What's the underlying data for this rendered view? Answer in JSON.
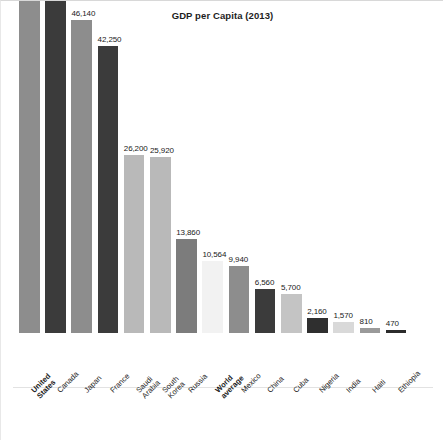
{
  "chart_data": {
    "type": "bar",
    "title": "GDP per Capita (2013)",
    "xlabel": "",
    "ylabel": "",
    "ylim": [
      0,
      53670
    ],
    "grid": false,
    "legend": null,
    "value_labels_shown": true,
    "categories": [
      "United\nStates",
      "Canada",
      "Japan",
      "France",
      "Saudi\nArabia",
      "South\nKorea",
      "Russia",
      "World\naverage",
      "Mexico",
      "China",
      "Cuba",
      "Nigeria",
      "India",
      "Haiti",
      "Ethiopia"
    ],
    "values": [
      53670,
      52200,
      46140,
      42250,
      26200,
      25920,
      13860,
      10564,
      9940,
      6560,
      5700,
      2160,
      1570,
      810,
      470
    ],
    "value_labels": [
      "53,670",
      "52,200",
      "46,140",
      "42,250",
      "26,200",
      "25,920",
      "13,860",
      "10,564",
      "9,940",
      "6,560",
      "5,700",
      "2,160",
      "1,570",
      "810",
      "470"
    ],
    "highlighted_categories": [
      "United\nStates",
      "World\naverage"
    ],
    "bar_colors": [
      "#8d8d8d",
      "#3b3b3b",
      "#8d8d8d",
      "#3b3b3b",
      "#b9b9b9",
      "#b9b9b9",
      "#7c7c7c",
      "#f2f2f2",
      "#8d8d8d",
      "#3b3b3b",
      "#c4c4c4",
      "#2f2f2f",
      "#d9d9d9",
      "#9a9a9a",
      "#2b2b2b"
    ]
  },
  "colors": {
    "background": "#ffffff",
    "text": "#1a1a1a",
    "axis": "#e2e2e2"
  }
}
